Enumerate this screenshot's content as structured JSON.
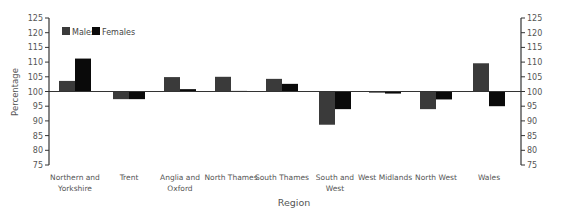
{
  "chart_data": {
    "type": "bar",
    "title": "",
    "xlabel": "Region",
    "ylabel": "Percentage",
    "ylim": [
      75,
      125
    ],
    "yticks": [
      75,
      80,
      85,
      90,
      95,
      100,
      105,
      110,
      115,
      120,
      125
    ],
    "baseline": 100,
    "grid": false,
    "legend_position": "top-left",
    "dual_y_axis": true,
    "categories": [
      "Northern and Yorkshire",
      "Trent",
      "Anglia and Oxford",
      "North Thames",
      "South Thames",
      "South and West",
      "West Midlands",
      "North West",
      "Wales"
    ],
    "category_label_lines": [
      [
        "Northern and",
        "Yorkshire"
      ],
      [
        "Trent"
      ],
      [
        "Anglia and",
        "Oxford"
      ],
      [
        "North Thames"
      ],
      [
        "South Thames"
      ],
      [
        "South and",
        "West"
      ],
      [
        "West Midlands"
      ],
      [
        "North West"
      ],
      [
        "Wales"
      ]
    ],
    "series": [
      {
        "name": "Males",
        "color": "#3a3a3a",
        "values": [
          103.6,
          97.4,
          104.9,
          105.0,
          104.3,
          88.7,
          99.6,
          94.0,
          109.6
        ]
      },
      {
        "name": "Females",
        "color": "#0a0a0a",
        "values": [
          111.2,
          97.4,
          100.8,
          100.2,
          102.6,
          94.0,
          99.3,
          97.3,
          95.0
        ]
      }
    ]
  },
  "legend": {
    "males_label": "Males",
    "females_label": "Females"
  },
  "axes": {
    "xlabel": "Region",
    "ylabel": "Percentage"
  }
}
